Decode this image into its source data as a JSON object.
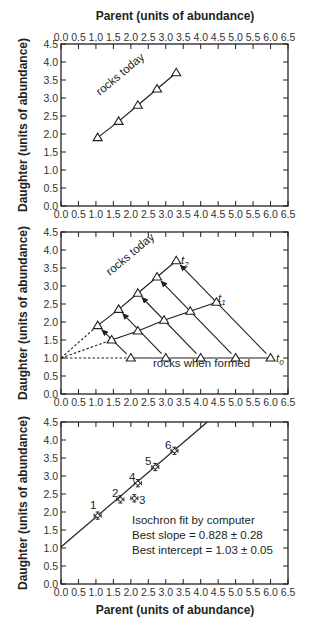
{
  "chart_data": [
    {
      "type": "line",
      "id": "panel-top",
      "title": "",
      "xlabel": "Parent (units of abundance)",
      "ylabel": "Daughter (units of abundance)",
      "x_axis_position": "top",
      "xlim": [
        0,
        6.5
      ],
      "ylim": [
        0,
        4.5
      ],
      "xticks": [
        "0.0",
        "0.5",
        "1.0",
        "1.5",
        "2.0",
        "2.5",
        "3.0",
        "3.5",
        "4.0",
        "4.5",
        "5.0",
        "5.5",
        "6.0",
        "6.5"
      ],
      "yticks": [
        "0.0",
        "0.5",
        "1.0",
        "1.5",
        "2.0",
        "2.5",
        "3.0",
        "3.5",
        "4.0",
        "4.5"
      ],
      "grid": false,
      "series": [
        {
          "name": "rocks today",
          "marker": "triangle",
          "x": [
            1.05,
            1.65,
            2.2,
            2.75,
            3.3
          ],
          "y": [
            1.9,
            2.35,
            2.8,
            3.25,
            3.7
          ]
        }
      ],
      "annotations": [
        {
          "text": "rocks today",
          "x": 1.9,
          "y": 2.75,
          "rotation": -40
        }
      ]
    },
    {
      "type": "line",
      "id": "panel-middle",
      "title": "",
      "xlabel": "",
      "ylabel": "Daughter (units of abundance)",
      "xlim": [
        0,
        6.5
      ],
      "ylim": [
        0,
        4.5
      ],
      "xticks": [
        "0.0",
        "0.5",
        "1.0",
        "1.5",
        "2.0",
        "2.5",
        "3.0",
        "3.5",
        "4.0",
        "4.5",
        "5.0",
        "5.5",
        "6.0",
        "6.5"
      ],
      "yticks": [
        "0.0",
        "0.5",
        "1.0",
        "1.5",
        "2.0",
        "2.5",
        "3.0",
        "3.5",
        "4.0",
        "4.5"
      ],
      "grid": false,
      "series": [
        {
          "name": "t0 (rocks when formed)",
          "marker": "triangle",
          "x": [
            2.0,
            3.0,
            4.0,
            5.0,
            6.0
          ],
          "y": [
            1.0,
            1.0,
            1.0,
            1.0,
            1.0
          ]
        },
        {
          "name": "t1",
          "marker": "triangle",
          "x": [
            1.45,
            2.2,
            2.95,
            3.7,
            4.45
          ],
          "y": [
            1.5,
            1.75,
            2.05,
            2.3,
            2.55
          ]
        },
        {
          "name": "t2 (rocks today)",
          "marker": "triangle",
          "x": [
            1.05,
            1.65,
            2.2,
            2.75,
            3.3
          ],
          "y": [
            1.9,
            2.35,
            2.8,
            3.25,
            3.7
          ]
        }
      ],
      "dashed_extensions": [
        {
          "from": [
            0,
            1.0
          ],
          "to": [
            2.0,
            1.0
          ]
        },
        {
          "from": [
            0,
            1.0
          ],
          "to": [
            1.45,
            1.5
          ]
        },
        {
          "from": [
            0,
            1.0
          ],
          "to": [
            1.05,
            1.9
          ]
        }
      ],
      "arrows": [
        {
          "from": [
            2.0,
            1.0
          ],
          "to": [
            1.05,
            1.9
          ]
        },
        {
          "from": [
            3.0,
            1.0
          ],
          "to": [
            1.65,
            2.35
          ]
        },
        {
          "from": [
            4.0,
            1.0
          ],
          "to": [
            2.2,
            2.8
          ]
        },
        {
          "from": [
            5.0,
            1.0
          ],
          "to": [
            2.75,
            3.25
          ]
        },
        {
          "from": [
            6.0,
            1.0
          ],
          "to": [
            3.3,
            3.7
          ]
        }
      ],
      "annotations": [
        {
          "text": "rocks today",
          "x": 1.9,
          "y": 2.75,
          "rotation": -40
        },
        {
          "text": "rocks when formed",
          "x": 4.0,
          "y": 0.7
        },
        {
          "text": "t",
          "sub": "2",
          "x": 3.45,
          "y": 3.7
        },
        {
          "text": "t",
          "sub": "1",
          "x": 4.6,
          "y": 2.55
        },
        {
          "text": "t",
          "sub": "0",
          "x": 6.15,
          "y": 1.0
        }
      ]
    },
    {
      "type": "scatter",
      "id": "panel-bottom",
      "title": "",
      "xlabel": "Parent (units of abundance)",
      "ylabel": "Daughter (units of abundance)",
      "xlim": [
        0,
        6.5
      ],
      "ylim": [
        0,
        4.5
      ],
      "xticks": [
        "0.0",
        "0.5",
        "1.0",
        "1.5",
        "2.0",
        "2.5",
        "3.0",
        "3.5",
        "4.0",
        "4.5",
        "5.0",
        "5.5",
        "6.0",
        "6.5"
      ],
      "yticks": [
        "0.0",
        "0.5",
        "1.0",
        "1.5",
        "2.0",
        "2.5",
        "3.0",
        "3.5",
        "4.0",
        "4.5"
      ],
      "grid": false,
      "series": [
        {
          "name": "samples",
          "marker": "circle-errorbar",
          "labels": [
            "1",
            "2",
            "3",
            "4",
            "5",
            "6"
          ],
          "x": [
            1.05,
            1.7,
            2.1,
            2.2,
            2.7,
            3.25
          ],
          "y": [
            1.9,
            2.35,
            2.38,
            2.8,
            3.25,
            3.7
          ],
          "x_err": 0.1,
          "y_err": 0.1
        }
      ],
      "fit_line": {
        "slope": 0.828,
        "intercept": 1.03,
        "x_range": [
          0,
          4.19
        ]
      },
      "annotations": [
        {
          "text": "Isochron fit by computer"
        },
        {
          "text": "Best slope = 0.828 ± 0.28"
        },
        {
          "text": "Best intercept = 1.03 ± 0.05"
        }
      ]
    }
  ],
  "labels": {
    "x_title": "Parent (units of abundance)",
    "y_title": "Daughter (units of abundance)",
    "rocks_today": "rocks today",
    "rocks_when_formed": "rocks when formed",
    "t": "t",
    "t0_sub": "0",
    "t1_sub": "1",
    "t2_sub": "2",
    "fit_line1": "Isochron fit by computer",
    "fit_line2": "Best slope = 0.828 ± 0.28",
    "fit_line3": "Best intercept = 1.03 ± 0.05",
    "pt1": "1",
    "pt2": "2",
    "pt3": "3",
    "pt4": "4",
    "pt5": "5",
    "pt6": "6"
  }
}
